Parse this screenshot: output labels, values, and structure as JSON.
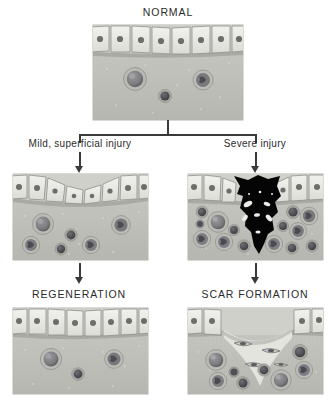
{
  "diagram": {
    "type": "flowchart",
    "nodes": {
      "normal": {
        "label": "NORMAL",
        "style": "caps"
      },
      "regeneration": {
        "label": "REGENERATION",
        "style": "caps"
      },
      "scar": {
        "label": "SCAR FORMATION",
        "style": "caps"
      }
    },
    "edges": {
      "mild": {
        "label": "Mild, superficial injury",
        "style": "sentence"
      },
      "severe": {
        "label": "Severe injury",
        "style": "sentence"
      }
    }
  },
  "panels": {
    "normal": {
      "name": "normal-tissue-panel",
      "epithelium": "intact-columnar-epithelium",
      "stroma_cells": 3,
      "surface": "intact"
    },
    "mild_injury": {
      "name": "mild-injury-panel",
      "epithelium": "flattened-attenuated-epithelium",
      "stroma_cells": 6,
      "surface": "shallow-erosion"
    },
    "severe_injury": {
      "name": "severe-injury-panel",
      "epithelium": "disrupted-epithelium",
      "stroma_cells": 14,
      "surface": "deep-necrotic-ulcer",
      "necrosis_color": "#050505"
    },
    "regeneration": {
      "name": "regeneration-panel",
      "epithelium": "restored-columnar-epithelium",
      "stroma_cells": 3,
      "surface": "intact"
    },
    "scar_formation": {
      "name": "scar-formation-panel",
      "epithelium": "interrupted-epithelium",
      "stroma_cells": 8,
      "fibroblasts": 4,
      "surface": "depressed-scar"
    }
  },
  "colors": {
    "background": "#ffffff",
    "text": "#2b2b2b",
    "connector": "#3a3a3a",
    "stroma": "#c3c3bd",
    "stroma_dark": "#b0b0a9",
    "epithelium_fill": "#ebebe7",
    "epithelium_outline": "#8f8f8a",
    "nucleus": "#6e6e69",
    "cell_dark": "#55555a",
    "cell_mid": "#8a8a8e",
    "scar_tissue": "#e2e2dd",
    "necrosis": "#050505"
  }
}
